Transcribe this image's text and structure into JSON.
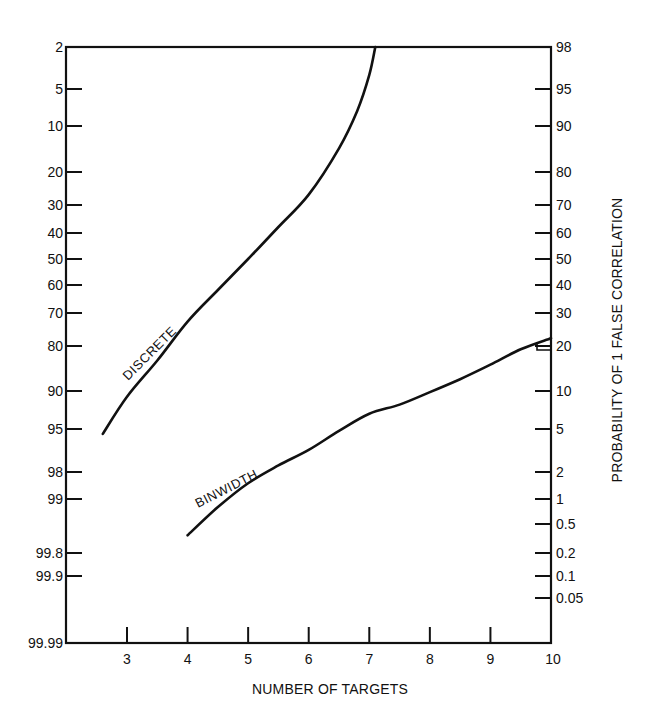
{
  "chart_data": {
    "type": "line",
    "title": "",
    "xlabel": "NUMBER OF TARGETS",
    "ylabel_left": "",
    "ylabel_right": "PROBABILITY OF 1 FALSE CORRELATION",
    "xlim": [
      2,
      10
    ],
    "x_ticks": [
      3,
      4,
      5,
      6,
      7,
      8,
      9,
      10
    ],
    "left_axis_ticks": [
      "2",
      "5",
      "10",
      "20",
      "30",
      "40",
      "50",
      "60",
      "70",
      "80",
      "90",
      "95",
      "98",
      "99",
      "99.8",
      "99.9",
      "99.99"
    ],
    "right_axis_ticks": [
      "98",
      "95",
      "90",
      "80",
      "70",
      "60",
      "50",
      "40",
      "30",
      "20",
      "10",
      "5",
      "2",
      "1",
      "0.5",
      "0.2",
      "0.1",
      "0.05"
    ],
    "right_axis_scale": "probability (normal) scale",
    "grid": false,
    "series": [
      {
        "name": "DISCRETE",
        "x": [
          2.6,
          3.0,
          3.5,
          4.0,
          4.5,
          5.0,
          5.5,
          6.0,
          6.5,
          6.8,
          7.0,
          7.1
        ],
        "values": [
          4.5,
          9,
          16,
          27,
          38,
          50,
          62,
          73,
          85,
          92,
          96,
          98
        ]
      },
      {
        "name": "BINWIDTH",
        "x": [
          4.0,
          4.5,
          5.0,
          5.5,
          6.0,
          6.5,
          7.0,
          7.5,
          8.0,
          8.5,
          9.0,
          9.5,
          10.0
        ],
        "values": [
          0.35,
          0.8,
          1.5,
          2.3,
          3.2,
          4.8,
          6.6,
          7.8,
          9.8,
          12,
          15,
          19,
          22
        ]
      }
    ]
  }
}
